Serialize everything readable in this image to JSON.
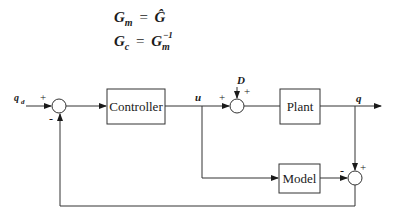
{
  "equations": [
    {
      "lhs": "G",
      "lhs_sub": "m",
      "op": "=",
      "rhs": "Ĝ",
      "rhs_sub": "",
      "rhs_sup": ""
    },
    {
      "lhs": "G",
      "lhs_sub": "c",
      "op": "=",
      "rhs": "G",
      "rhs_sub": "m",
      "rhs_sup": "−1"
    }
  ],
  "diagram": {
    "blocks": [
      {
        "id": "controller",
        "label": "Controller"
      },
      {
        "id": "plant",
        "label": "Plant"
      },
      {
        "id": "model",
        "label": "Model"
      }
    ],
    "signals": {
      "reference": "q",
      "reference_sub": "d",
      "control": "u",
      "disturbance": "D",
      "output": "q"
    },
    "signs": {
      "sum1_ref": "+",
      "sum1_feedback": "-",
      "sum2_u": "+",
      "sum2_d": "+",
      "sum3_plant": "+",
      "sum3_model": "-"
    }
  }
}
